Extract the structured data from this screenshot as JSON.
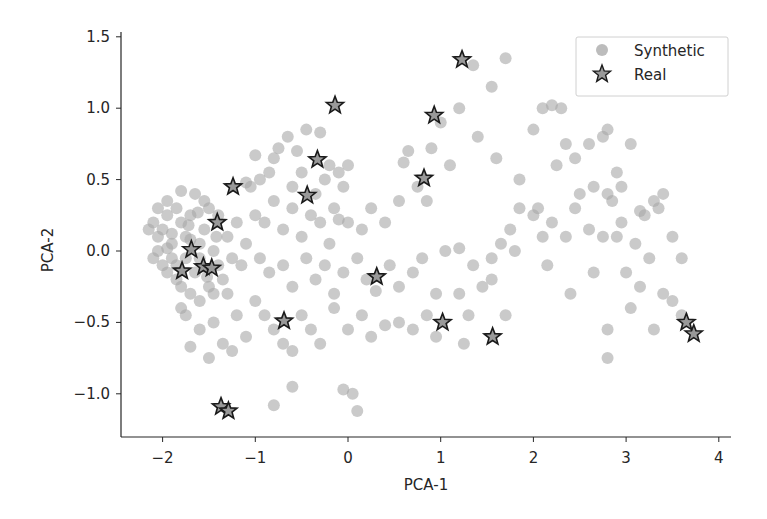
{
  "chart_data": {
    "type": "scatter",
    "title": "",
    "xlabel": "PCA-1",
    "ylabel": "PCA-2",
    "xlim": [
      -2.45,
      4.12
    ],
    "ylim": [
      -1.3,
      1.53
    ],
    "xticks": [
      -2,
      -1,
      0,
      1,
      2,
      3,
      4
    ],
    "xtick_labels": [
      "−2",
      "−1",
      "0",
      "1",
      "2",
      "3",
      "4"
    ],
    "yticks": [
      1.5,
      1.0,
      0.5,
      0.0,
      -0.5,
      -1.0
    ],
    "ytick_labels": [
      "1.5",
      "1.0",
      "0.5",
      "0.0",
      "−0.5",
      "−1.0"
    ],
    "grid": false,
    "legend_position": "upper right",
    "series": [
      {
        "name": "Synthetic",
        "marker": "circle",
        "color": "#a6a6a6",
        "points": [
          [
            -2.1,
            0.2
          ],
          [
            -2.05,
            0.1
          ],
          [
            -2.0,
            0.15
          ],
          [
            -1.95,
            0.25
          ],
          [
            -1.9,
            0.05
          ],
          [
            -1.85,
            0.3
          ],
          [
            -1.9,
            -0.05
          ],
          [
            -2.0,
            -0.1
          ],
          [
            -1.95,
            -0.15
          ],
          [
            -1.8,
            0.2
          ],
          [
            -1.75,
            0.1
          ],
          [
            -1.7,
            0.25
          ],
          [
            -1.85,
            -0.2
          ],
          [
            -1.8,
            -0.25
          ],
          [
            -1.7,
            -0.3
          ],
          [
            -1.65,
            -0.15
          ],
          [
            -1.6,
            0.05
          ],
          [
            -1.55,
            0.15
          ],
          [
            -1.5,
            0.3
          ],
          [
            -1.45,
            0.0
          ],
          [
            -1.4,
            -0.1
          ],
          [
            -1.35,
            -0.2
          ],
          [
            -1.5,
            -0.25
          ],
          [
            -1.6,
            -0.35
          ],
          [
            -1.45,
            -0.3
          ],
          [
            -1.3,
            0.1
          ],
          [
            -1.25,
            -0.05
          ],
          [
            -1.2,
            0.2
          ],
          [
            -1.55,
            0.35
          ],
          [
            -1.65,
            0.4
          ],
          [
            -1.8,
            0.42
          ],
          [
            -1.95,
            0.35
          ],
          [
            -2.05,
            0.0
          ],
          [
            -2.1,
            -0.05
          ],
          [
            -1.75,
            -0.05
          ],
          [
            -1.6,
            -0.05
          ],
          [
            -1.4,
            0.25
          ],
          [
            -1.3,
            -0.3
          ],
          [
            -1.15,
            -0.1
          ],
          [
            -1.1,
            0.05
          ],
          [
            -1.75,
            -0.45
          ],
          [
            -1.6,
            -0.55
          ],
          [
            -1.45,
            -0.5
          ],
          [
            -1.35,
            -0.65
          ],
          [
            -1.25,
            -0.7
          ],
          [
            -1.5,
            -0.75
          ],
          [
            -1.8,
            -0.4
          ],
          [
            -1.7,
            -0.67
          ],
          [
            -1.05,
            0.45
          ],
          [
            -1.1,
            0.48
          ],
          [
            -0.95,
            0.5
          ],
          [
            -0.85,
            0.55
          ],
          [
            -1.0,
            0.67
          ],
          [
            -0.75,
            0.72
          ],
          [
            -0.65,
            0.8
          ],
          [
            -0.8,
            0.65
          ],
          [
            -0.55,
            0.7
          ],
          [
            -0.5,
            0.55
          ],
          [
            -0.45,
            0.85
          ],
          [
            -0.6,
            0.45
          ],
          [
            -0.3,
            0.83
          ],
          [
            -0.2,
            0.6
          ],
          [
            -0.1,
            0.55
          ],
          [
            0.0,
            0.6
          ],
          [
            -0.05,
            0.45
          ],
          [
            -0.25,
            0.5
          ],
          [
            -0.35,
            0.4
          ],
          [
            -0.15,
            0.3
          ],
          [
            -0.4,
            0.25
          ],
          [
            -0.6,
            0.3
          ],
          [
            -0.8,
            0.35
          ],
          [
            -0.9,
            0.2
          ],
          [
            -1.0,
            0.25
          ],
          [
            -0.7,
            0.15
          ],
          [
            -0.5,
            0.1
          ],
          [
            -0.3,
            0.2
          ],
          [
            -0.2,
            0.05
          ],
          [
            -0.1,
            0.22
          ],
          [
            0.0,
            0.2
          ],
          [
            0.15,
            0.15
          ],
          [
            0.25,
            0.3
          ],
          [
            0.4,
            0.2
          ],
          [
            0.55,
            0.35
          ],
          [
            0.6,
            0.62
          ],
          [
            0.65,
            0.7
          ],
          [
            0.75,
            0.45
          ],
          [
            0.9,
            0.72
          ],
          [
            1.0,
            0.9
          ],
          [
            1.1,
            0.6
          ],
          [
            0.85,
            0.35
          ],
          [
            -0.95,
            -0.05
          ],
          [
            -0.85,
            -0.15
          ],
          [
            -0.7,
            -0.1
          ],
          [
            -0.6,
            -0.25
          ],
          [
            -0.45,
            -0.05
          ],
          [
            -0.35,
            -0.2
          ],
          [
            -0.25,
            -0.1
          ],
          [
            -0.15,
            -0.3
          ],
          [
            -0.05,
            -0.15
          ],
          [
            0.1,
            -0.05
          ],
          [
            0.2,
            -0.2
          ],
          [
            0.3,
            -0.28
          ],
          [
            0.45,
            -0.1
          ],
          [
            0.55,
            -0.25
          ],
          [
            0.7,
            -0.15
          ],
          [
            0.8,
            -0.05
          ],
          [
            0.95,
            -0.3
          ],
          [
            1.05,
            0.0
          ],
          [
            1.2,
            0.02
          ],
          [
            1.35,
            -0.1
          ],
          [
            -1.0,
            -0.35
          ],
          [
            -0.9,
            -0.45
          ],
          [
            -0.8,
            -0.55
          ],
          [
            -0.7,
            -0.65
          ],
          [
            -0.6,
            -0.7
          ],
          [
            -1.1,
            -0.6
          ],
          [
            -1.2,
            -0.45
          ],
          [
            -0.5,
            -0.45
          ],
          [
            -0.4,
            -0.55
          ],
          [
            -0.3,
            -0.65
          ],
          [
            -0.15,
            -0.4
          ],
          [
            0.0,
            -0.55
          ],
          [
            0.15,
            -0.45
          ],
          [
            0.25,
            -0.6
          ],
          [
            0.4,
            -0.52
          ],
          [
            0.55,
            -0.5
          ],
          [
            0.7,
            -0.55
          ],
          [
            0.85,
            -0.45
          ],
          [
            0.95,
            -0.6
          ],
          [
            1.2,
            -0.3
          ],
          [
            1.3,
            -0.45
          ],
          [
            1.45,
            -0.25
          ],
          [
            1.55,
            -0.05
          ],
          [
            1.65,
            0.05
          ],
          [
            1.75,
            0.15
          ],
          [
            1.85,
            0.3
          ],
          [
            2.0,
            0.25
          ],
          [
            2.1,
            0.1
          ],
          [
            2.2,
            0.2
          ],
          [
            2.35,
            0.1
          ],
          [
            2.45,
            0.3
          ],
          [
            2.6,
            0.15
          ],
          [
            2.75,
            0.1
          ],
          [
            2.85,
            0.35
          ],
          [
            2.95,
            0.2
          ],
          [
            3.1,
            0.05
          ],
          [
            3.2,
            0.25
          ],
          [
            3.35,
            0.3
          ],
          [
            3.5,
            0.1
          ],
          [
            3.6,
            -0.05
          ],
          [
            1.2,
            1.0
          ],
          [
            1.35,
            1.3
          ],
          [
            1.55,
            1.15
          ],
          [
            1.7,
            1.35
          ],
          [
            1.4,
            0.8
          ],
          [
            1.6,
            0.65
          ],
          [
            1.85,
            0.5
          ],
          [
            2.1,
            1.0
          ],
          [
            2.2,
            1.02
          ],
          [
            2.3,
            1.0
          ],
          [
            2.0,
            0.85
          ],
          [
            2.25,
            0.6
          ],
          [
            2.35,
            0.75
          ],
          [
            2.45,
            0.65
          ],
          [
            2.6,
            0.75
          ],
          [
            2.75,
            0.8
          ],
          [
            2.8,
            0.85
          ],
          [
            2.9,
            0.55
          ],
          [
            3.05,
            0.75
          ],
          [
            2.65,
            0.45
          ],
          [
            2.8,
            0.4
          ],
          [
            2.95,
            0.45
          ],
          [
            3.15,
            0.28
          ],
          [
            3.3,
            0.35
          ],
          [
            3.4,
            0.4
          ],
          [
            2.05,
            0.3
          ],
          [
            2.5,
            0.4
          ],
          [
            2.9,
            0.1
          ],
          [
            3.0,
            -0.15
          ],
          [
            3.15,
            -0.25
          ],
          [
            2.4,
            -0.3
          ],
          [
            2.65,
            -0.15
          ],
          [
            3.25,
            -0.05
          ],
          [
            3.4,
            -0.3
          ],
          [
            3.5,
            -0.35
          ],
          [
            3.6,
            -0.45
          ],
          [
            2.8,
            -0.55
          ],
          [
            2.8,
            -0.75
          ],
          [
            3.3,
            -0.55
          ],
          [
            3.05,
            -0.4
          ],
          [
            1.55,
            -0.2
          ],
          [
            1.8,
            0.0
          ],
          [
            2.15,
            -0.1
          ],
          [
            1.7,
            -0.45
          ],
          [
            1.25,
            -0.65
          ],
          [
            -0.05,
            -0.97
          ],
          [
            0.05,
            -1.0
          ],
          [
            0.1,
            -1.12
          ],
          [
            -0.8,
            -1.08
          ],
          [
            -0.6,
            -0.95
          ],
          [
            -1.7,
            0.08
          ],
          [
            -1.9,
            0.12
          ],
          [
            -2.15,
            0.15
          ],
          [
            -2.05,
            0.3
          ],
          [
            -1.95,
            0.02
          ],
          [
            -1.85,
            -0.1
          ],
          [
            -1.72,
            0.18
          ],
          [
            -1.62,
            0.27
          ],
          [
            -1.52,
            -0.18
          ],
          [
            -1.42,
            0.1
          ]
        ]
      },
      {
        "name": "Real",
        "marker": "star",
        "color": "#999999",
        "edgecolor": "#1a1a1a",
        "points": [
          [
            1.23,
            1.34
          ],
          [
            -0.14,
            1.02
          ],
          [
            0.93,
            0.95
          ],
          [
            -0.33,
            0.64
          ],
          [
            -1.24,
            0.45
          ],
          [
            -0.44,
            0.39
          ],
          [
            0.82,
            0.51
          ],
          [
            -1.41,
            0.2
          ],
          [
            -1.69,
            0.01
          ],
          [
            -1.56,
            -0.11
          ],
          [
            -1.47,
            -0.12
          ],
          [
            -1.79,
            -0.14
          ],
          [
            0.31,
            -0.18
          ],
          [
            -0.69,
            -0.49
          ],
          [
            1.02,
            -0.5
          ],
          [
            1.56,
            -0.6
          ],
          [
            3.65,
            -0.5
          ],
          [
            3.73,
            -0.58
          ],
          [
            -1.37,
            -1.09
          ],
          [
            -1.29,
            -1.12
          ]
        ]
      }
    ]
  },
  "legend": {
    "items": [
      {
        "label": "Synthetic",
        "marker": "circle"
      },
      {
        "label": "Real",
        "marker": "star"
      }
    ]
  }
}
